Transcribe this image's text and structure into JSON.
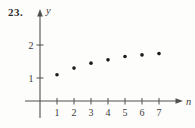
{
  "figure": {
    "problem_number": "23."
  },
  "chart_data": {
    "type": "scatter",
    "x": [
      1,
      2,
      3,
      4,
      5,
      6,
      7
    ],
    "y": [
      1.1,
      1.3,
      1.45,
      1.55,
      1.65,
      1.7,
      1.74
    ],
    "title": "",
    "xlabel": "n",
    "ylabel": "y",
    "x_ticks": [
      1,
      2,
      3,
      4,
      5,
      6,
      7
    ],
    "y_ticks": [
      1,
      2
    ],
    "xlim": [
      0,
      8.5
    ],
    "ylim": [
      0,
      2.9
    ],
    "grid": false,
    "legend": "none",
    "marker_color": "#1c1c1c",
    "axis_color": "#505050",
    "text_color": "#3b3b3b"
  }
}
